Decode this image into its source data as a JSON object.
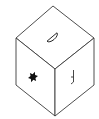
{
  "diagram": {
    "type": "isometric-cube",
    "colors": {
      "background": "#ffffff",
      "stroke": "#3a3a3a",
      "symbol_fill": "#111111"
    },
    "vertices": {
      "top": [
        53,
        6
      ],
      "left_top": [
        16,
        38
      ],
      "right_top": [
        94,
        38
      ],
      "center": [
        55,
        69
      ],
      "left_bottom": [
        16,
        85
      ],
      "right_bottom": [
        94,
        85
      ],
      "bottom": [
        55,
        116
      ]
    },
    "faces": [
      {
        "name": "top",
        "symbol": "half-circle-outline",
        "symbol_center": [
          52,
          37
        ]
      },
      {
        "name": "left",
        "symbol": "six-pointed-star-filled",
        "symbol_center": [
          33,
          77
        ]
      },
      {
        "name": "right",
        "symbol": "hooked-vertical-glyph",
        "symbol_center": [
          73,
          77
        ]
      }
    ]
  }
}
